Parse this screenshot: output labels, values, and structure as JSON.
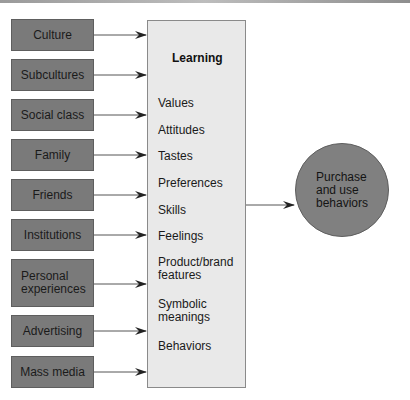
{
  "diagram": {
    "sources": [
      {
        "label": "Culture"
      },
      {
        "label": "Subcultures"
      },
      {
        "label": "Social class"
      },
      {
        "label": "Family"
      },
      {
        "label": "Friends"
      },
      {
        "label": "Institutions"
      },
      {
        "label": "Personal\nexperiences"
      },
      {
        "label": "Advertising"
      },
      {
        "label": "Mass media"
      }
    ],
    "learning": {
      "title": "Learning",
      "items": [
        "Values",
        "Attitudes",
        "Tastes",
        "Preferences",
        "Skills",
        "Feelings",
        "Product/brand\nfeatures",
        "Symbolic\nmeanings",
        "Behaviors"
      ]
    },
    "outcome": {
      "label": "Purchase\nand use\nbehaviors"
    },
    "colors": {
      "source_fill": "#7a7a7a",
      "learning_fill": "#e9e9e9",
      "outcome_fill": "#808080",
      "arrow": "#222222"
    }
  }
}
